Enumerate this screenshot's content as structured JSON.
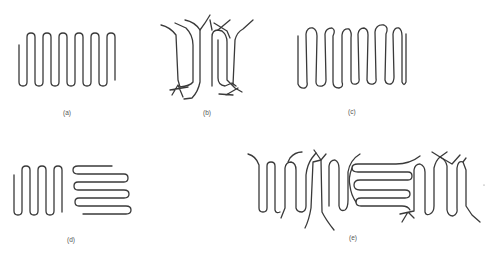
{
  "figure": {
    "panels": [
      {
        "id": "a",
        "label": "(a)",
        "description": "regular adjacent-reentry folded chain"
      },
      {
        "id": "b",
        "label": "(b)",
        "description": "switchboard model, random reentry with loose cilia"
      },
      {
        "id": "c",
        "label": "(c)",
        "description": "irregular adjacent-reentry folded chain"
      },
      {
        "id": "d",
        "label": "(d)",
        "description": "two folded lamellae at right angles"
      },
      {
        "id": "e",
        "label": "(e)",
        "description": "combined folded chains with loose ends and tie molecules"
      }
    ],
    "colors": {
      "stroke": "#3a3a3a",
      "background": "#ffffff",
      "label": "#555555"
    }
  }
}
